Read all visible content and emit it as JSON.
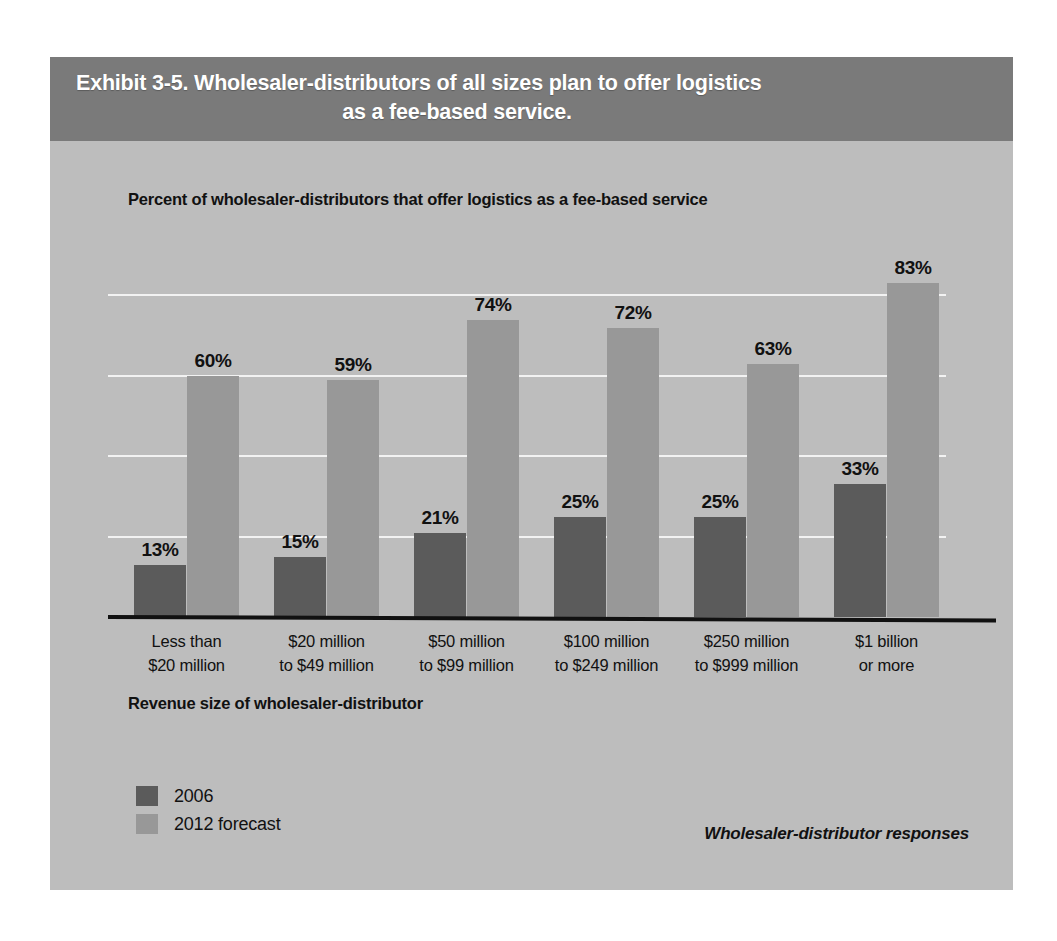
{
  "exhibit": {
    "title_line_1": "Exhibit 3-5. Wholesaler-distributors of all sizes plan to offer logistics",
    "title_line_2": "as a fee-based service.",
    "source_note": "Wholesaler-distributor responses"
  },
  "colors": {
    "page_background": "#ffffff",
    "panel_background": "#bdbdbd",
    "header_band": "#7a7a7a",
    "header_text": "#ffffff",
    "series_2006": "#5b5b5b",
    "series_2012": "#989898",
    "gridline": "#f2f2f2",
    "axis": "#111111",
    "text": "#111111"
  },
  "chart_data": {
    "type": "bar",
    "title": "Percent of wholesaler-distributors that offer logistics as a fee-based service",
    "xlabel": "Revenue size of wholesaler-distributor",
    "ylabel": "",
    "ylim": [
      0,
      100
    ],
    "grid": true,
    "gridline_values": [
      80,
      60,
      40,
      20
    ],
    "legend_position": "bottom-left",
    "categories": [
      "Less than $20 million",
      "$20 million to $49 million",
      "$50 million to $99 million",
      "$100 million to $249 million",
      "$250 million to $999 million",
      "$1 billion or more"
    ],
    "category_lines": [
      [
        "Less than",
        "$20 million"
      ],
      [
        "$20 million",
        "to $49 million"
      ],
      [
        "$50 million",
        "to $99 million"
      ],
      [
        "$100 million",
        "to $249 million"
      ],
      [
        "$250 million",
        "to $999 million"
      ],
      [
        "$1 billion",
        "or more"
      ]
    ],
    "series": [
      {
        "name": "2006",
        "color": "#5b5b5b",
        "values": [
          13,
          15,
          21,
          25,
          25,
          33
        ],
        "labels": [
          "13%",
          "15%",
          "21%",
          "25%",
          "25%",
          "33%"
        ]
      },
      {
        "name": "2012 forecast",
        "color": "#989898",
        "values": [
          60,
          59,
          74,
          72,
          63,
          83
        ],
        "labels": [
          "60%",
          "59%",
          "74%",
          "72%",
          "63%",
          "83%"
        ]
      }
    ]
  }
}
